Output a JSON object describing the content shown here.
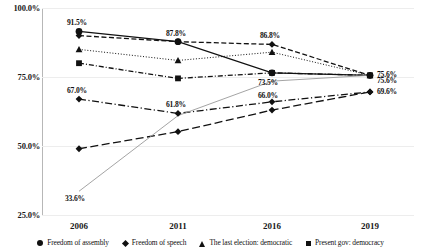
{
  "chart_data": {
    "type": "line",
    "title": "",
    "xlabel": "",
    "ylabel": "",
    "x": [
      "2006",
      "2011",
      "2016",
      "2019"
    ],
    "categories": [
      "2006",
      "2011",
      "2016",
      "2019"
    ],
    "ylim": [
      25.0,
      100.0
    ],
    "y_ticks": [
      "25.0%",
      "50.0%",
      "75.0%",
      "100.0%"
    ],
    "y_tick_values": [
      25.0,
      50.0,
      75.0,
      100.0
    ],
    "grid": true,
    "legend_position": "bottom",
    "series": [
      {
        "name": "Freedom of assembly",
        "marker": "circle",
        "line": "solid",
        "values": [
          91.5,
          87.8,
          76.5,
          75.6
        ],
        "labels": [
          "91.5%",
          "87.8%",
          "",
          "75.6%"
        ]
      },
      {
        "name": "Freedom of speech",
        "marker": "diamond",
        "line": "dashed",
        "values": [
          90.0,
          87.8,
          86.8,
          75.6
        ],
        "labels": [
          "",
          "",
          "86.8%",
          "75.6%"
        ]
      },
      {
        "name": "The last election: democratic",
        "marker": "triangle",
        "line": "dotted",
        "values": [
          85.0,
          81.0,
          84.0,
          75.6
        ],
        "labels": [
          "",
          "",
          "",
          ""
        ]
      },
      {
        "name": "Present gov: democracy",
        "marker": "square",
        "line": "dash-dot",
        "values": [
          80.0,
          74.5,
          76.5,
          75.6
        ],
        "labels": [
          "",
          "",
          "",
          ""
        ]
      },
      {
        "name": "series-5",
        "marker": "diamond",
        "line": "dash-dot-long",
        "values": [
          67.0,
          61.8,
          66.0,
          69.6
        ],
        "labels": [
          "67.0%",
          "61.8%",
          "66.0%",
          "69.6%"
        ]
      },
      {
        "name": "series-6",
        "marker": "diamond",
        "line": "long-dash",
        "values": [
          49.0,
          55.2,
          63.0,
          69.6
        ],
        "labels": [
          "",
          "",
          "",
          ""
        ]
      },
      {
        "name": "series-7",
        "marker": "none",
        "line": "thin-solid-gray",
        "values": [
          33.6,
          61.0,
          73.5,
          75.6
        ],
        "labels": [
          "33.6%",
          "",
          "73.5%",
          ""
        ]
      }
    ]
  },
  "legend": {
    "items": [
      {
        "label": "Freedom of assembly",
        "marker": "circle"
      },
      {
        "label": "Freedom of speech",
        "marker": "diamond"
      },
      {
        "label": "The last election: democratic",
        "marker": "triangle"
      },
      {
        "label": "Present gov: democracy",
        "marker": "square"
      }
    ]
  },
  "colors": {
    "line": "#111111",
    "gray_line": "#9a9a9a",
    "grid": "#ededed",
    "axis": "#b7b7b7",
    "text": "#111111"
  }
}
